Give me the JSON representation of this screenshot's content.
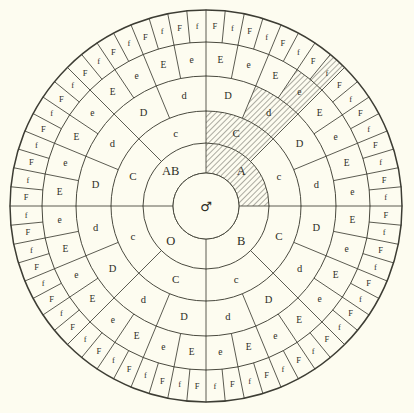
{
  "figure": {
    "background_color": "#fdfcf0",
    "ink_color": "#3d3d34",
    "center_symbol": "♂",
    "center_symbol_name": "mars-male-symbol"
  },
  "geometry": {
    "center_x": 206,
    "center_y": 206,
    "radii": [
      33,
      63,
      95,
      130,
      164,
      196
    ]
  },
  "hatch": {
    "color": "#4a4a3f",
    "path_labels": [
      "O",
      "C",
      "d",
      "E",
      "F"
    ],
    "ring1_index": 3,
    "ring2_index": 6,
    "ring3_index": 13,
    "ring4_index": 27,
    "ring5_index": 55
  },
  "rings": [
    {
      "name": "ring-1-blood-group",
      "count": 4,
      "labels": [
        "B",
        "O",
        "AB",
        "A"
      ]
    },
    {
      "name": "ring-2-c-factor",
      "count": 8,
      "labels": [
        "C",
        "c",
        "C",
        "c",
        "C",
        "c",
        "C",
        "c"
      ]
    },
    {
      "name": "ring-3-d-factor",
      "count": 16,
      "labels": [
        "D",
        "d",
        "D",
        "d",
        "D",
        "d",
        "D",
        "d",
        "D",
        "d",
        "D",
        "d",
        "D",
        "d",
        "D",
        "d"
      ]
    },
    {
      "name": "ring-4-e-factor",
      "count": 32,
      "labels": [
        "E",
        "e",
        "E",
        "e",
        "E",
        "e",
        "E",
        "e",
        "E",
        "e",
        "E",
        "e",
        "E",
        "e",
        "E",
        "e",
        "E",
        "e",
        "E",
        "e",
        "E",
        "e",
        "E",
        "e",
        "E",
        "e",
        "E",
        "e",
        "E",
        "e",
        "E",
        "e"
      ]
    },
    {
      "name": "ring-5-f-factor",
      "count": 64,
      "labels": [
        "F",
        "f",
        "F",
        "f",
        "F",
        "f",
        "F",
        "f",
        "F",
        "f",
        "F",
        "f",
        "F",
        "f",
        "F",
        "f",
        "F",
        "f",
        "F",
        "f",
        "F",
        "f",
        "F",
        "f",
        "F",
        "f",
        "F",
        "f",
        "F",
        "f",
        "F",
        "f",
        "F",
        "f",
        "F",
        "f",
        "F",
        "f",
        "F",
        "f",
        "F",
        "f",
        "F",
        "f",
        "F",
        "f",
        "F",
        "f",
        "F",
        "f",
        "F",
        "f",
        "F",
        "f",
        "F",
        "f",
        "F",
        "f",
        "F",
        "f",
        "F",
        "f",
        "F",
        "f"
      ]
    }
  ]
}
